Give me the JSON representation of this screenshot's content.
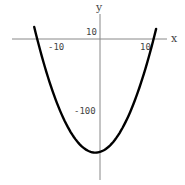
{
  "chart_data": {
    "type": "line",
    "title": "",
    "xlabel": "x",
    "ylabel": "y",
    "function": "y = x^2 + 2x - 159 (approx.)",
    "xlim": [
      -19,
      14.5
    ],
    "ylim": [
      -200,
      35
    ],
    "x_ticks": [
      {
        "value": -10,
        "label": "-10"
      },
      {
        "value": 10,
        "label": "10"
      }
    ],
    "y_ticks": [
      {
        "value": 10,
        "label": "10"
      },
      {
        "value": -100,
        "label": "-100"
      }
    ],
    "grid": false,
    "legend": null,
    "series": [
      {
        "name": "parabola",
        "color": "#000000",
        "x": [
          -14.3,
          -13,
          -12,
          -10,
          -8,
          -6,
          -4,
          -2,
          -1,
          0,
          2,
          4,
          6,
          8,
          10,
          11,
          12.2
        ],
        "values": [
          18.9,
          -14,
          -39,
          -79,
          -111,
          -135,
          -151,
          -159,
          -160,
          -159,
          -151,
          -135,
          -111,
          -79,
          -39,
          -14,
          13.2
        ]
      }
    ]
  },
  "labels": {
    "x_axis": "x",
    "y_axis": "y",
    "tick_x_neg10": "-10",
    "tick_x_10": "10",
    "tick_y_10": "10",
    "tick_y_neg100": "-100"
  }
}
